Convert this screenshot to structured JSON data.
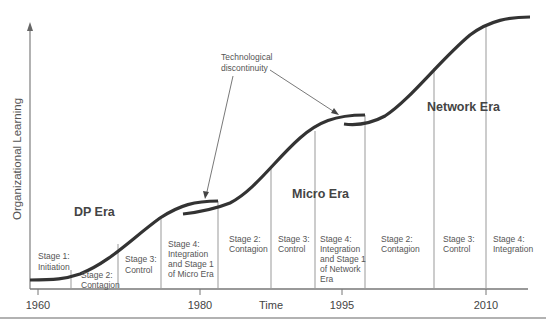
{
  "diagram": {
    "y_axis_label": "Organizational Learning",
    "x_axis_label": "Time",
    "x_ticks": [
      {
        "label": "1960",
        "x": 38
      },
      {
        "label": "1980",
        "x": 200
      },
      {
        "label": "1995",
        "x": 342
      },
      {
        "label": "2010",
        "x": 486
      }
    ],
    "annotation": "Technological discontinuity",
    "annotation_lines": [
      "Technological",
      "discontinuity"
    ],
    "eras": [
      {
        "label": "DP Era"
      },
      {
        "label": "Micro Era"
      },
      {
        "label": "Network Era"
      }
    ],
    "stages": [
      {
        "lines": [
          "Stage 1:",
          "Initiation"
        ]
      },
      {
        "lines": [
          "Stage 2:",
          "Contagion"
        ]
      },
      {
        "lines": [
          "Stage 3:",
          "Control"
        ]
      },
      {
        "lines": [
          "Stage 4:",
          "Integration",
          "and Stage 1",
          "of Micro Era"
        ]
      },
      {
        "lines": [
          "Stage 2:",
          "Contagion"
        ]
      },
      {
        "lines": [
          "Stage 3:",
          "Control"
        ]
      },
      {
        "lines": [
          "Stage 4:",
          "Integration",
          "and Stage 1",
          "of Network",
          "Era"
        ]
      },
      {
        "lines": [
          "Stage 2:",
          "Contagion"
        ]
      },
      {
        "lines": [
          "Stage 3:",
          "Control"
        ]
      },
      {
        "lines": [
          "Stage 4:",
          "Integration"
        ]
      }
    ]
  }
}
